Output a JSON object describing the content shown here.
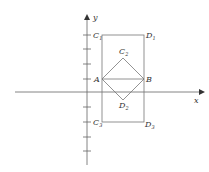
{
  "diagram": {
    "axes": {
      "x_label": "x",
      "y_label": "y",
      "color": "#555555"
    },
    "points": {
      "A": {
        "label": "A",
        "sub": ""
      },
      "B": {
        "label": "B",
        "sub": ""
      },
      "C1": {
        "label": "C",
        "sub": "1"
      },
      "D1": {
        "label": "D",
        "sub": "1"
      },
      "C2": {
        "label": "C",
        "sub": "2"
      },
      "D2": {
        "label": "D",
        "sub": "2"
      },
      "C3": {
        "label": "C",
        "sub": "3"
      },
      "D3": {
        "label": "D",
        "sub": "3"
      }
    },
    "shapes": [
      "rectangle C1 D1 D3 C3",
      "square A C2 B D2",
      "segment AB"
    ],
    "line_color": "#777777"
  }
}
